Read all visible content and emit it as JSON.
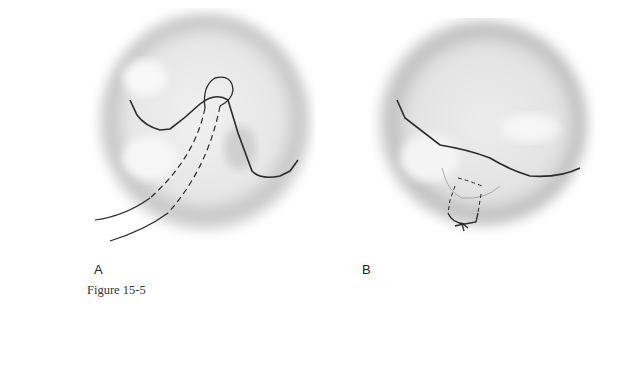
{
  "figure": {
    "caption": "Figure 15-5",
    "panels": [
      {
        "label": "A",
        "description": "Valve viewed from above with suture passed as a loop around the commissure; dashed lines indicate suture path beneath tissue"
      },
      {
        "label": "B",
        "description": "Valve after suture tied, closing the commissural area with a knot at the bottom"
      }
    ]
  },
  "colors": {
    "background": "#ffffff",
    "tissue_shadow": "#b8b8b8",
    "tissue_light": "#f2f2f2",
    "line": "#2a2a2a"
  }
}
